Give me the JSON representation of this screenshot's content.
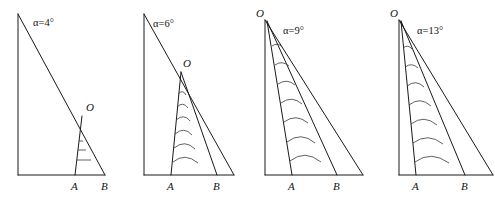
{
  "figure": {
    "type": "diagram",
    "panel_count": 4,
    "point_label_O": "O",
    "point_label_A": "A",
    "point_label_B": "B",
    "alpha_symbol": "α",
    "degree_symbol": "°",
    "equals": "=",
    "line_color": "#1a1a1a",
    "slip_color": "#3a3a3a",
    "background": "#ffffff"
  },
  "panels": [
    {
      "id": "panel-4deg",
      "angle_label": "α=4°",
      "angle_value": 4,
      "angle_unit": "°",
      "label_O": "O",
      "label_A": "A",
      "label_B": "B",
      "slip_line_count": 3,
      "wedge_width_px": 23,
      "apex_y_px": 112
    },
    {
      "id": "panel-6deg",
      "angle_label": "α=6°",
      "angle_value": 6,
      "angle_unit": "°",
      "label_O": "O",
      "label_A": "A",
      "label_B": "B",
      "slip_line_count": 6,
      "wedge_width_px": 45,
      "apex_y_px": 70
    },
    {
      "id": "panel-9deg",
      "angle_label": "α=9°",
      "angle_value": 9,
      "angle_unit": "°",
      "label_O": "O",
      "label_A": "A",
      "label_B": "B",
      "slip_line_count": 7,
      "wedge_width_px": 58,
      "apex_y_px": 18
    },
    {
      "id": "panel-13deg",
      "angle_label": "α=13°",
      "angle_value": 13,
      "angle_unit": "°",
      "label_O": "O",
      "label_A": "A",
      "label_B": "B",
      "slip_line_count": 7,
      "wedge_width_px": 62,
      "apex_y_px": 18
    }
  ]
}
